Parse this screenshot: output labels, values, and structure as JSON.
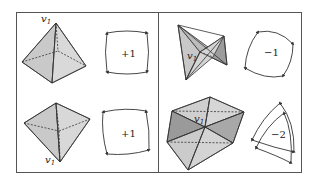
{
  "figure": {
    "frame": {
      "x": 16,
      "y": 12,
      "width": 286,
      "height": 161
    },
    "divider_x": 158,
    "colors": {
      "stroke": "#333333",
      "face_light": "#d6d6d6",
      "face_mid": "#c4c4c4",
      "face_dark": "#9a9a9a",
      "frame": "#555555"
    },
    "panels": [
      {
        "id": "top-left",
        "vertex_label": "v",
        "vertex_subscript": "1",
        "solid": "pyramid-apex-up",
        "index_label": "+1"
      },
      {
        "id": "top-right",
        "vertex_label": "v",
        "vertex_subscript": "1",
        "solid": "folded-bowtie",
        "index_label": "−1"
      },
      {
        "id": "bottom-left",
        "vertex_label": "v",
        "vertex_subscript": "1",
        "solid": "pyramid-apex-down",
        "index_label": "+1"
      },
      {
        "id": "bottom-right",
        "vertex_label": "v",
        "vertex_subscript": "1",
        "solid": "folded-star",
        "index_label": "−2"
      }
    ]
  }
}
